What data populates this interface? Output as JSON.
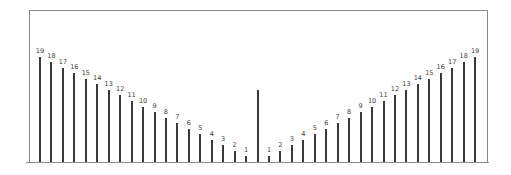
{
  "chart_data": {
    "type": "bar",
    "title": "",
    "xlabel": "",
    "ylabel": "",
    "grid": false,
    "legend": null,
    "categories": [
      "L19",
      "L18",
      "L17",
      "L16",
      "L15",
      "L14",
      "L13",
      "L12",
      "L11",
      "L10",
      "L9",
      "L8",
      "L7",
      "L6",
      "L5",
      "L4",
      "L3",
      "L2",
      "L1",
      "center",
      "R1",
      "R2",
      "R3",
      "R4",
      "R5",
      "R6",
      "R7",
      "R8",
      "R9",
      "R10",
      "R11",
      "R12",
      "R13",
      "R14",
      "R15",
      "R16",
      "R17",
      "R18",
      "R19"
    ],
    "values": [
      19,
      18,
      17,
      16,
      15,
      14,
      13,
      12,
      11,
      10,
      9,
      8,
      7,
      6,
      5,
      4,
      3,
      2,
      1,
      13,
      1,
      2,
      3,
      4,
      5,
      6,
      7,
      8,
      9,
      10,
      11,
      12,
      13,
      14,
      15,
      16,
      17,
      18,
      19
    ],
    "labels": [
      "19",
      "18",
      "17",
      "16",
      "15",
      "14",
      "13",
      "12",
      "11",
      "10",
      "9",
      "8",
      "7",
      "6",
      "5",
      "4",
      "3",
      "2",
      "1",
      "",
      "1",
      "2",
      "3",
      "4",
      "5",
      "6",
      "7",
      "8",
      "9",
      "10",
      "11",
      "12",
      "13",
      "14",
      "15",
      "16",
      "17",
      "18",
      "19"
    ],
    "ylim": [
      0,
      26
    ]
  },
  "colors": {
    "bar": "#3a3a3a",
    "axis": "#8a8a8a",
    "background": "#ffffff"
  }
}
